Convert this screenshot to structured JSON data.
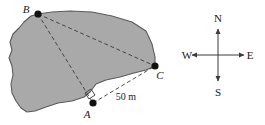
{
  "figure": {
    "colors": {
      "parcel_fill": "#a9a9a9",
      "parcel_stroke": "#5a5a5a",
      "survey_line": "#3a3a3a",
      "vertex_marker": "#121212",
      "text": "#1a1a1a",
      "background": "#ffffff"
    }
  },
  "parcel": {
    "name": "land-parcel",
    "fill": "#a9a9a9",
    "stroke": "#5a5a5a",
    "outline_points": "38,14 52,12 70,11 92,12 112,16 132,22 146,31 152,44 155,57 155,66 146,70 134,73 120,77 106,80 96,84 90,92 84,97 72,101 58,103 46,107 35,111 27,112 21,108 16,101 12,93 11,84 13,75 12,66 9,58 12,50 10,42 13,34 19,28 24,22 31,16"
  },
  "vertices": [
    {
      "id": "B",
      "label": "B",
      "name": "vertex-point-b",
      "x": 38,
      "y": 14,
      "radius": 3.6,
      "label_x": 26,
      "label_y": 13
    },
    {
      "id": "C",
      "label": "C",
      "name": "vertex-point-c",
      "x": 155,
      "y": 66,
      "radius": 3.6,
      "label_x": 160,
      "label_y": 79
    },
    {
      "id": "A",
      "label": "A",
      "name": "vertex-point-a",
      "x": 93,
      "y": 103,
      "radius": 3.6,
      "label_x": 87,
      "label_y": 118
    }
  ],
  "survey_lines": [
    {
      "name": "survey-line-b-to-a",
      "from": "B",
      "to": "A",
      "x1": 38,
      "y1": 14,
      "x2": 93,
      "y2": 103,
      "style": "dashed"
    },
    {
      "name": "survey-line-b-to-c",
      "from": "B",
      "to": "C",
      "x1": 38,
      "y1": 14,
      "x2": 155,
      "y2": 66,
      "style": "dashed"
    },
    {
      "name": "survey-line-a-to-c",
      "from": "A",
      "to": "C",
      "x1": 93,
      "y1": 103,
      "x2": 155,
      "y2": 66,
      "style": "dashed"
    }
  ],
  "measurements": [
    {
      "name": "distance-label-a-c",
      "text": "50 m",
      "value": 50,
      "unit": "m",
      "applies_to": "A-C",
      "x": 126,
      "y": 100
    }
  ],
  "right_angle": {
    "name": "right-angle-marker-at-a",
    "at_vertex": "A",
    "points": "85,93 91,89 95,95 89,99",
    "stroke": "#3a3a3a"
  },
  "compass": {
    "name": "compass-rose",
    "center_x": 218,
    "center_y": 55,
    "arm_length": 30,
    "directions": [
      {
        "id": "N",
        "label": "N",
        "name": "compass-direction-north",
        "label_x": 218,
        "label_y": 22,
        "x2": 218,
        "y2": 29
      },
      {
        "id": "S",
        "label": "S",
        "name": "compass-direction-south",
        "label_x": 218,
        "label_y": 96,
        "x2": 218,
        "y2": 81
      },
      {
        "id": "W",
        "label": "W",
        "name": "compass-direction-west",
        "label_x": 187,
        "label_y": 59,
        "x2": 192,
        "y2": 55
      },
      {
        "id": "E",
        "label": "E",
        "name": "compass-direction-east",
        "label_x": 250,
        "label_y": 59,
        "x2": 244,
        "y2": 55
      }
    ]
  }
}
